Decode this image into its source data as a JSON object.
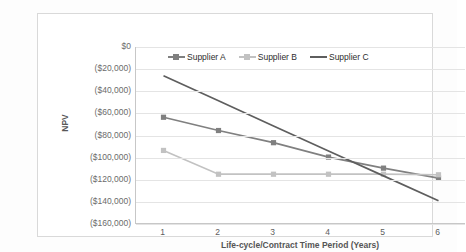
{
  "chart_data": {
    "type": "line",
    "title": "",
    "xlabel": "Life-cycle/Contract Time Period (Years)",
    "ylabel": "NPV",
    "x": [
      1,
      2,
      3,
      4,
      5,
      6
    ],
    "xticklabels": [
      "1",
      "2",
      "3",
      "4",
      "5",
      "6"
    ],
    "yticklabels": [
      "$0",
      "($20,000)",
      "($40,000)",
      "($60,000)",
      "($80,000)",
      "($100,000)",
      "($120,000)",
      "($140,000)",
      "($160,000)"
    ],
    "ytickvalues": [
      0,
      -20000,
      -40000,
      -60000,
      -80000,
      -100000,
      -120000,
      -140000,
      -160000
    ],
    "ylim": [
      -160000,
      0
    ],
    "xlim": [
      0.5,
      6.5
    ],
    "grid": "horizontal",
    "legend_position": "top-center",
    "series": [
      {
        "name": "Supplier A",
        "color": "#808080",
        "marker": "square",
        "values": [
          -63500,
          -75500,
          -86500,
          -99500,
          -109500,
          -118500
        ]
      },
      {
        "name": "Supplier B",
        "color": "#c2c2c2",
        "marker": "square",
        "values": [
          -93500,
          -115000,
          -115000,
          -115000,
          -115000,
          -115500
        ]
      },
      {
        "name": "Supplier C",
        "color": "#5e5e5e",
        "marker": "none",
        "values": [
          -26000,
          -48500,
          -71500,
          -94000,
          -116500,
          -139000
        ]
      }
    ]
  },
  "legend": {
    "items": [
      {
        "label": "Supplier A"
      },
      {
        "label": "Supplier B"
      },
      {
        "label": "Supplier C"
      }
    ]
  },
  "axes": {
    "y_title": "NPV",
    "x_title": "Life-cycle/Contract Time Period (Years)"
  },
  "colors": {
    "supplier_a": "#808080",
    "supplier_b": "#c2c2c2",
    "supplier_c": "#5e5e5e",
    "grid": "#e4e4e4",
    "axis": "#c7c7c7",
    "tick_text": "#6b6b6b",
    "frame": "#d9d9d9",
    "background": "#ffffff"
  }
}
